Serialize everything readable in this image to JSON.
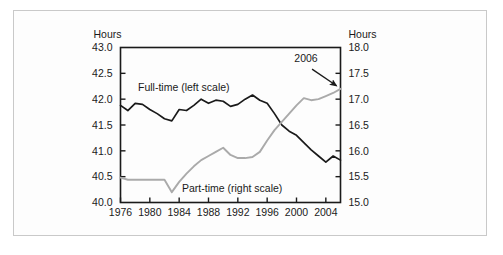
{
  "figure": {
    "background_color": "#fdfdfd",
    "border_color": "#c9c9c9"
  },
  "chart_data": {
    "type": "line",
    "title": "",
    "xlabel": "",
    "ylabel": "Hours",
    "y2label": "Hours",
    "left_axis_title": "Hours",
    "right_axis_title": "Hours",
    "grid": false,
    "legend": "inline-annotations",
    "xlim": [
      1976,
      2006
    ],
    "ylim": [
      40.0,
      43.0
    ],
    "y2lim": [
      15.0,
      18.0
    ],
    "x_ticks": [
      1976,
      1980,
      1984,
      1988,
      1992,
      1996,
      2000,
      2004
    ],
    "x_tick_labels": [
      "1976",
      "1980",
      "1984",
      "1988",
      "1992",
      "1996",
      "2000",
      "2004"
    ],
    "y_ticks": [
      40.0,
      40.5,
      41.0,
      41.5,
      42.0,
      42.5,
      43.0
    ],
    "y_tick_labels": [
      "40.0",
      "40.5",
      "41.0",
      "41.5",
      "42.0",
      "42.5",
      "43.0"
    ],
    "y2_ticks": [
      15.0,
      15.5,
      16.0,
      16.5,
      17.0,
      17.5,
      18.0
    ],
    "y2_tick_labels": [
      "15.0",
      "15.5",
      "16.0",
      "16.5",
      "17.0",
      "17.5",
      "18.0"
    ],
    "x": [
      1976,
      1977,
      1978,
      1979,
      1980,
      1981,
      1982,
      1983,
      1984,
      1985,
      1986,
      1987,
      1988,
      1989,
      1990,
      1991,
      1992,
      1993,
      1994,
      1995,
      1996,
      1997,
      1998,
      1999,
      2000,
      2001,
      2002,
      2003,
      2004,
      2005,
      2006
    ],
    "series": [
      {
        "name": "Full-time (left scale)",
        "axis": "left",
        "color": "#1a1a1a",
        "label": "Full-time (left scale)",
        "values": [
          41.88,
          41.78,
          41.92,
          41.9,
          41.8,
          41.72,
          41.62,
          41.58,
          41.8,
          41.78,
          41.88,
          42.0,
          41.92,
          41.98,
          41.96,
          41.86,
          41.9,
          42.0,
          42.08,
          41.98,
          41.92,
          41.72,
          41.5,
          41.38,
          41.3,
          41.16,
          41.02,
          40.9,
          40.78,
          40.9,
          40.82
        ]
      },
      {
        "name": "Part-time (right scale)",
        "axis": "right",
        "color": "#aaaaaa",
        "label": "Part-time (right scale)",
        "values": [
          15.48,
          15.44,
          15.44,
          15.44,
          15.44,
          15.44,
          15.44,
          15.2,
          15.4,
          15.56,
          15.7,
          15.82,
          15.9,
          15.98,
          16.06,
          15.92,
          15.86,
          15.86,
          15.88,
          15.98,
          16.2,
          16.4,
          16.56,
          16.72,
          16.88,
          17.02,
          16.98,
          17.0,
          17.06,
          17.12,
          17.2
        ]
      }
    ],
    "annotations": [
      {
        "text": "2006",
        "x": 2001.3,
        "y_right": 17.62,
        "arrow_to_x": 2005.6,
        "arrow_to_y_right": 17.22
      }
    ]
  }
}
